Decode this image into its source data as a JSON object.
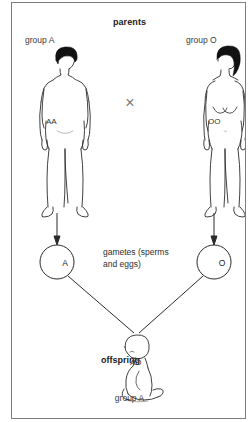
{
  "diagram": {
    "title": "parents",
    "topic": "abo-blood-group-inheritance",
    "parents": [
      {
        "side": "left",
        "sex": "male",
        "blood_group_label": "group A",
        "genotype": "AA",
        "gamete": "A"
      },
      {
        "side": "right",
        "sex": "female",
        "blood_group_label": "group O",
        "genotype": "OO",
        "gamete": "O"
      }
    ],
    "cross_symbol": "×",
    "gametes_caption_line1": "gametes (sperms",
    "gametes_caption_line2": "and eggs)",
    "offspring": {
      "label": "offspring",
      "genotype": "AO",
      "blood_group_label": "group A"
    },
    "colors": {
      "ink": "#1a1a1a",
      "line": "#2b2b2b",
      "hair": "#111111",
      "cross": "#7a7a7a",
      "frame": "#7d7d7d",
      "background": "#ffffff"
    }
  }
}
